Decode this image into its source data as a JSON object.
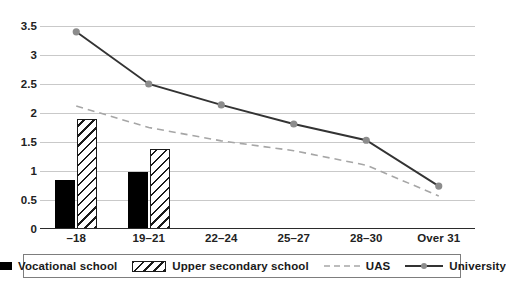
{
  "chart_data": {
    "type": "bar",
    "title": "",
    "subtitle": "",
    "xlabel": "",
    "ylabel": "",
    "categories": [
      "–18",
      "19–21",
      "22–24",
      "25–27",
      "28–30",
      "Over 31"
    ],
    "ylim": [
      0,
      3.5
    ],
    "yticks": [
      "0",
      "0.5",
      "1",
      "1.5",
      "2",
      "2.5",
      "3",
      "3.5"
    ],
    "ytick_values": [
      0,
      0.5,
      1,
      1.5,
      2,
      2.5,
      3,
      3.5
    ],
    "grid": true,
    "legend_position": "bottom",
    "series": [
      {
        "name": "Vocational school",
        "kind": "bar",
        "style": "solid-black",
        "color": "#000000",
        "values": [
          0.85,
          0.98,
          null,
          null,
          null,
          null
        ]
      },
      {
        "name": "Upper secondary school",
        "kind": "bar",
        "style": "hatched",
        "color": "#1a1a1a",
        "values": [
          1.89,
          1.38,
          null,
          null,
          null,
          null
        ]
      },
      {
        "name": "UAS",
        "kind": "line",
        "style": "dashed",
        "color": "#a6a6a6",
        "values": [
          2.12,
          1.75,
          1.52,
          1.35,
          1.1,
          0.57
        ]
      },
      {
        "name": "University",
        "kind": "line",
        "style": "solid-marker",
        "color": "#333333",
        "marker_color": "#8c8c8c",
        "values": [
          3.4,
          2.5,
          2.14,
          1.81,
          1.53,
          0.74
        ]
      }
    ]
  },
  "legend": {
    "items": [
      {
        "label": "Vocational school",
        "swatch": "solid-black-bar-swatch"
      },
      {
        "label": "Upper secondary school",
        "swatch": "hatched-bar-swatch"
      },
      {
        "label": "UAS",
        "swatch": "dashed-line-swatch"
      },
      {
        "label": "University",
        "swatch": "marker-line-swatch"
      }
    ]
  },
  "colors": {
    "grid": "#c9c9c9",
    "axis": "#2b2b2b",
    "bar_solid": "#000000",
    "bar_hatch_stroke": "#1a1a1a",
    "uas_line": "#a6a6a6",
    "university_line": "#333333",
    "university_marker": "#8c8c8c",
    "legend_border": "#7d7d7d",
    "text": "#1a1a1a"
  }
}
